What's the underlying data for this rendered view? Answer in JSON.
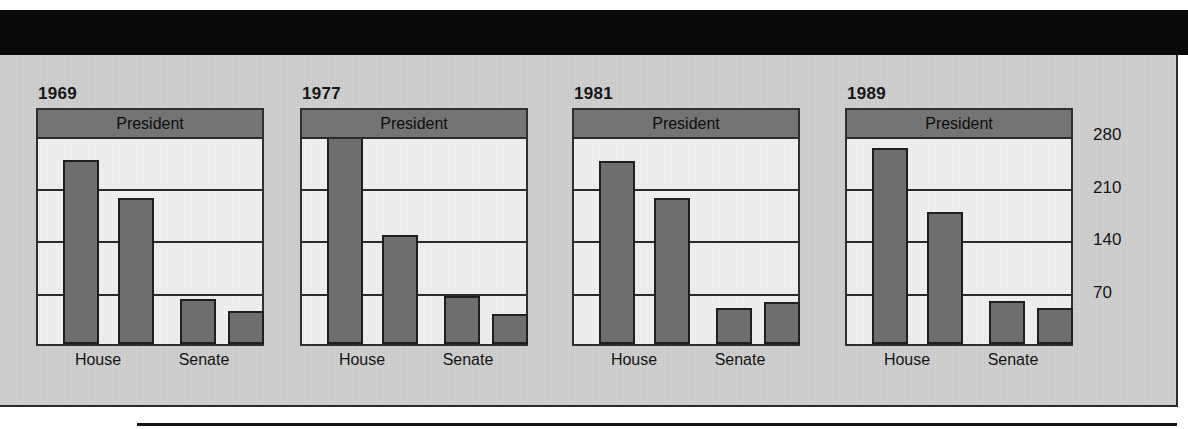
{
  "figure": {
    "president_band_label": "President",
    "x_categories": [
      "House",
      "Senate"
    ],
    "y_ticks": [
      "280",
      "210",
      "140",
      "70"
    ],
    "panels": [
      {
        "year": "1969"
      },
      {
        "year": "1977"
      },
      {
        "year": "1981"
      },
      {
        "year": "1989"
      }
    ],
    "colors": {
      "banner": "#0a0a0a",
      "panel_background": "#cfcfcf",
      "plot_background": "#f1f1f1",
      "bar_fill": "#6e6e6e",
      "band_fill": "#747474",
      "ink": "#1f1f1f"
    }
  },
  "chart_data": {
    "type": "bar",
    "title": "",
    "subtitle": "",
    "xlabel": "",
    "ylabel": "",
    "ylim": [
      0,
      320
    ],
    "grid": true,
    "gridlines": [
      70,
      140,
      210,
      280
    ],
    "legend_position": "none",
    "annotations": [
      "President"
    ],
    "categories": [
      "House",
      "Senate"
    ],
    "panel_variable": "year",
    "panels": [
      {
        "year": "1969",
        "series": [
          {
            "name": "House-majority",
            "category": "House",
            "value": 243
          },
          {
            "name": "House-minority",
            "category": "House",
            "value": 192
          },
          {
            "name": "Senate-majority",
            "category": "Senate",
            "value": 58
          },
          {
            "name": "Senate-minority",
            "category": "Senate",
            "value": 42
          }
        ]
      },
      {
        "year": "1977",
        "series": [
          {
            "name": "House-majority",
            "category": "House",
            "value": 292
          },
          {
            "name": "House-minority",
            "category": "House",
            "value": 143
          },
          {
            "name": "Senate-majority",
            "category": "Senate",
            "value": 61
          },
          {
            "name": "Senate-minority",
            "category": "Senate",
            "value": 38
          }
        ]
      },
      {
        "year": "1981",
        "series": [
          {
            "name": "House-majority",
            "category": "House",
            "value": 242
          },
          {
            "name": "House-minority",
            "category": "House",
            "value": 192
          },
          {
            "name": "Senate-majority",
            "category": "Senate",
            "value": 46
          },
          {
            "name": "Senate-minority",
            "category": "Senate",
            "value": 53
          }
        ]
      },
      {
        "year": "1989",
        "series": [
          {
            "name": "House-majority",
            "category": "House",
            "value": 259
          },
          {
            "name": "House-minority",
            "category": "House",
            "value": 174
          },
          {
            "name": "Senate-majority",
            "category": "Senate",
            "value": 55
          },
          {
            "name": "Senate-minority",
            "category": "Senate",
            "value": 45
          }
        ]
      }
    ]
  }
}
